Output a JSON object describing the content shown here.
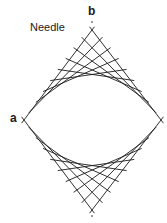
{
  "diagram": {
    "title": "Needle",
    "labels": {
      "a": "a",
      "b": "b"
    },
    "color": "#1a1a1a",
    "geometry": {
      "left": [
        24,
        120
      ],
      "right": [
        161,
        120
      ],
      "top": [
        92,
        30
      ],
      "bottom": [
        92,
        210
      ],
      "steps": 9
    }
  }
}
